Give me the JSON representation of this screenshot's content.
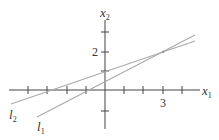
{
  "figure": {
    "axes": {
      "x_label": "x",
      "x_label_sub": "1",
      "y_label": "x",
      "y_label_sub": "2",
      "x_tick_label": "3",
      "y_tick_label": "2",
      "x_range": [
        -5,
        4.6
      ],
      "y_range": [
        -2,
        3
      ]
    },
    "lines": [
      {
        "name": "l",
        "sub": "1",
        "equation": "x2 = (x1 + 1)/2",
        "color": "#aaaaaa"
      },
      {
        "name": "l",
        "sub": "2",
        "equation": "x2 = x1/3 + 1",
        "color": "#aaaaaa"
      }
    ],
    "intersection": {
      "x1": 3,
      "x2": 2
    }
  }
}
